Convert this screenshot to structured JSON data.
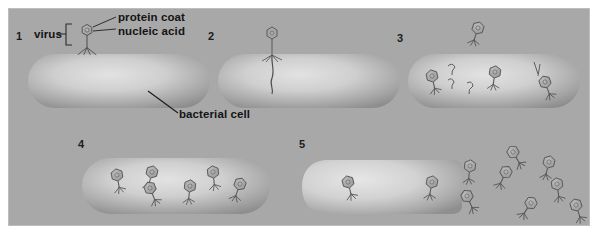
{
  "figure": {
    "background_color": "#a8a8a8",
    "page_color": "#ffffff",
    "cell_fill_light": "#d8d8d8",
    "cell_fill_dark": "#8e8e8e",
    "ink_color": "#4a4a4a",
    "text_color": "#141414"
  },
  "labels": {
    "virus": "virus",
    "protein_coat": "protein coat",
    "nucleic_acid": "nucleic acid",
    "bacterial_cell": "bacterial cell"
  },
  "steps": [
    {
      "number": "1",
      "caption": "virus attaches to bacterial cell",
      "phages_outside": 1,
      "phages_inside": 0,
      "cell_intact": true
    },
    {
      "number": "2",
      "caption": "virus injects nucleic acid into cell",
      "phages_outside": 1,
      "phages_inside": 0,
      "cell_intact": true
    },
    {
      "number": "3",
      "caption": "new viral parts are assembled inside cell",
      "phages_outside": 1,
      "phages_inside": 5,
      "cell_intact": true
    },
    {
      "number": "4",
      "caption": "complete new viruses fill the cell",
      "phages_outside": 0,
      "phages_inside": 6,
      "cell_intact": true
    },
    {
      "number": "5",
      "caption": "cell lyses and releases new viruses",
      "phages_outside": 8,
      "phages_inside": 2,
      "cell_intact": false
    }
  ],
  "icons": {
    "phage": "bacteriophage-icon",
    "capsule": "bacterial-cell-icon",
    "bracket": "bracket-icon",
    "leader_line": "leader-line-icon"
  }
}
